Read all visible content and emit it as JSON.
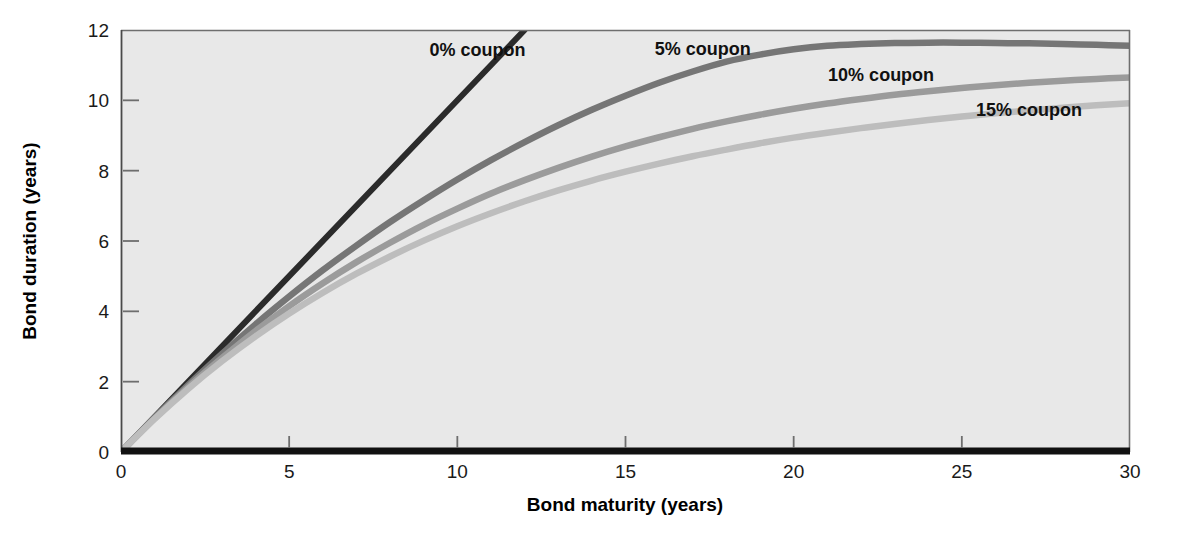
{
  "chart_data": {
    "type": "line",
    "title": "",
    "subtitle": "",
    "xlabel": "Bond maturity (years)",
    "ylabel": "Bond duration (years)",
    "xlim": [
      0,
      30
    ],
    "ylim": [
      0,
      12
    ],
    "xticks": [
      "0",
      "5",
      "10",
      "15",
      "20",
      "25",
      "30"
    ],
    "xtick_values": [
      0,
      5,
      10,
      15,
      20,
      25,
      30
    ],
    "yticks": [
      "0",
      "2",
      "4",
      "6",
      "8",
      "10",
      "12"
    ],
    "ytick_values": [
      0,
      2,
      4,
      6,
      8,
      10,
      12
    ],
    "grid": false,
    "legend_position": "inline-annotations",
    "plot_background": "#e8e8e8",
    "x": [
      0,
      1,
      2,
      3,
      4,
      5,
      6,
      7,
      8,
      9,
      10,
      11,
      12,
      13,
      14,
      15,
      16,
      17,
      18,
      19,
      20,
      21,
      22,
      23,
      24,
      25,
      26,
      27,
      28,
      29,
      30
    ],
    "series": [
      {
        "name": "0% coupon",
        "label": "0% coupon",
        "color": "#2b2b2b",
        "values": [
          0,
          1,
          2,
          3,
          4,
          5,
          6,
          7,
          8,
          9,
          10,
          11,
          12
        ],
        "x_values": [
          0,
          1,
          2,
          3,
          4,
          5,
          6,
          7,
          8,
          9,
          10,
          11,
          12
        ],
        "label_x": 10.6,
        "label_y": 11.25,
        "note": "duration equals maturity; line clipped at top of plot at maturity 12"
      },
      {
        "name": "5% coupon",
        "label": "5% coupon",
        "color": "#767676",
        "values": [
          0,
          0.98,
          1.91,
          2.79,
          3.63,
          4.42,
          5.17,
          5.87,
          6.54,
          7.16,
          7.75,
          8.3,
          8.81,
          9.29,
          9.73,
          10.13,
          10.5,
          10.82,
          11.1,
          11.3,
          11.45,
          11.55,
          11.6,
          11.63,
          11.64,
          11.64,
          11.63,
          11.62,
          11.6,
          11.58,
          11.55
        ],
        "label_x": 17.3,
        "label_y": 11.28
      },
      {
        "name": "10% coupon",
        "label": "10% coupon",
        "color": "#9b9b9b",
        "values": [
          0,
          0.96,
          1.85,
          2.67,
          3.44,
          4.15,
          4.8,
          5.4,
          5.95,
          6.46,
          6.92,
          7.35,
          7.73,
          8.08,
          8.4,
          8.69,
          8.95,
          9.19,
          9.4,
          9.59,
          9.76,
          9.91,
          10.04,
          10.16,
          10.26,
          10.35,
          10.43,
          10.5,
          10.56,
          10.61,
          10.65
        ],
        "label_x": 22.6,
        "label_y": 10.55
      },
      {
        "name": "15% coupon",
        "label": "15% coupon",
        "color": "#bdbdbd",
        "values": [
          0,
          0.94,
          1.8,
          2.58,
          3.29,
          3.94,
          4.53,
          5.07,
          5.56,
          6.01,
          6.42,
          6.79,
          7.13,
          7.44,
          7.72,
          7.97,
          8.2,
          8.41,
          8.6,
          8.78,
          8.94,
          9.08,
          9.21,
          9.33,
          9.44,
          9.54,
          9.63,
          9.71,
          9.79,
          9.86,
          9.92
        ],
        "label_x": 27.0,
        "label_y": 9.55
      }
    ]
  },
  "axes": {
    "x_title": "Bond maturity (years)",
    "y_title": "Bond duration (years)"
  }
}
